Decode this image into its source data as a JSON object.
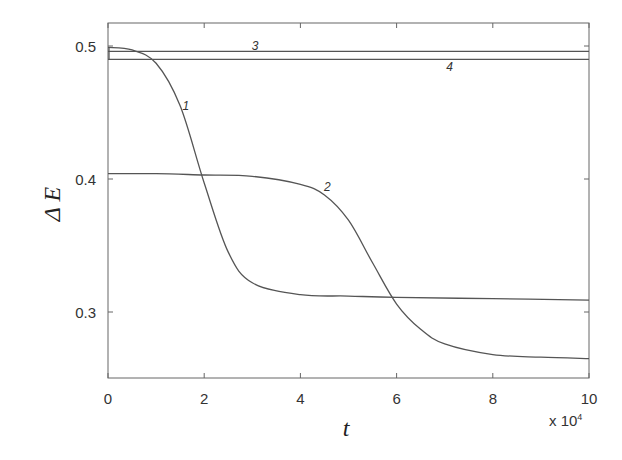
{
  "chart_data": {
    "type": "line",
    "title": "",
    "xlabel": "t",
    "ylabel": "Δ E",
    "x_multiplier": "x 10^4",
    "xlim": [
      0,
      10
    ],
    "ylim": [
      0.25,
      0.52
    ],
    "xticks": [
      0,
      2,
      4,
      6,
      8,
      10
    ],
    "xtick_labels": [
      "0",
      "2",
      "4",
      "6",
      "8",
      "10"
    ],
    "yticks": [
      0.3,
      0.4,
      0.5
    ],
    "ytick_labels": [
      "0.3",
      "0.4",
      "0.5"
    ],
    "grid": false,
    "legend": "inline curve labels",
    "series": [
      {
        "name": "1",
        "x": [
          0,
          0.5,
          1,
          1.5,
          2,
          2.5,
          3,
          4,
          5,
          6,
          8,
          10
        ],
        "values": [
          0.499,
          0.497,
          0.487,
          0.455,
          0.397,
          0.345,
          0.322,
          0.313,
          0.312,
          0.311,
          0.31,
          0.309
        ]
      },
      {
        "name": "2",
        "x": [
          0,
          1,
          2,
          3,
          4,
          4.5,
          5,
          5.5,
          6,
          6.5,
          7,
          8,
          9,
          10
        ],
        "values": [
          0.404,
          0.404,
          0.403,
          0.402,
          0.396,
          0.388,
          0.369,
          0.337,
          0.306,
          0.287,
          0.276,
          0.268,
          0.266,
          0.265
        ]
      },
      {
        "name": "3",
        "x": [
          0,
          10
        ],
        "values": [
          0.496,
          0.496
        ]
      },
      {
        "name": "4",
        "x": [
          0,
          10
        ],
        "values": [
          0.49,
          0.49
        ]
      }
    ],
    "annotations": [
      {
        "text": "1",
        "x": 1.62,
        "y": 0.452
      },
      {
        "text": "2",
        "x": 4.56,
        "y": 0.391
      },
      {
        "text": "3",
        "x": 3.06,
        "y": 0.497
      },
      {
        "text": "4",
        "x": 7.1,
        "y": 0.481
      }
    ]
  }
}
